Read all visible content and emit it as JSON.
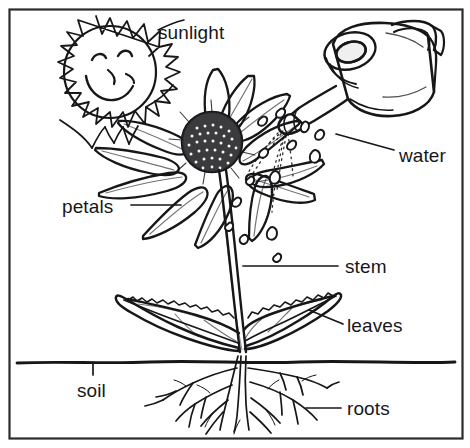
{
  "diagram": {
    "style": "black-and-white line drawing / coloring-book illustration",
    "background_color": "#ffffff",
    "ink_color": "#17171a",
    "frame": {
      "present": true,
      "shape": "rectangle",
      "stroke_color": "#2b2b2e"
    }
  },
  "labels": [
    {
      "id": "sunlight",
      "text": "sunlight",
      "leader": "none"
    },
    {
      "id": "water",
      "text": "water",
      "leader": "diagonal-line"
    },
    {
      "id": "petals",
      "text": "petals",
      "leader": "horizontal-line"
    },
    {
      "id": "stem",
      "text": "stem",
      "leader": "horizontal-line"
    },
    {
      "id": "leaves",
      "text": "leaves",
      "leader": "diagonal-line"
    },
    {
      "id": "soil",
      "text": "soil",
      "leader": "vertical-tick"
    },
    {
      "id": "roots",
      "text": "roots",
      "leader": "horizontal-line"
    }
  ],
  "objects": {
    "sun": {
      "name": "sun",
      "face": "smiling",
      "features": [
        "two-eyes",
        "nose",
        "smile",
        "spiky-rays"
      ]
    },
    "watering_can": {
      "name": "watering-can",
      "parts": [
        "spout",
        "body",
        "handle",
        "top-opening"
      ],
      "pouring": true
    },
    "flower": {
      "name": "flower-head",
      "type": "daisy-like",
      "center": "stippled-disc",
      "petal_count": 12
    },
    "water_drops": {
      "name": "water-drops",
      "count": 14,
      "trajectory": "dotted-lines"
    },
    "stem": {
      "name": "stem"
    },
    "leaves": {
      "name": "leaves",
      "count": 2
    },
    "soil_line": {
      "name": "soil-line"
    },
    "roots": {
      "name": "root-system"
    }
  }
}
